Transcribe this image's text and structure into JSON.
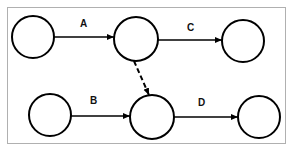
{
  "diagram": {
    "type": "activity-network",
    "nodes": [
      {
        "id": "n1",
        "label": ""
      },
      {
        "id": "n2",
        "label": ""
      },
      {
        "id": "n3",
        "label": ""
      },
      {
        "id": "n4",
        "label": ""
      },
      {
        "id": "n5",
        "label": ""
      },
      {
        "id": "n6",
        "label": ""
      }
    ],
    "edges": [
      {
        "from": "n1",
        "to": "n2",
        "label": "A",
        "style": "solid"
      },
      {
        "from": "n2",
        "to": "n3",
        "label": "C",
        "style": "solid"
      },
      {
        "from": "n4",
        "to": "n5",
        "label": "B",
        "style": "solid"
      },
      {
        "from": "n5",
        "to": "n6",
        "label": "D",
        "style": "solid"
      },
      {
        "from": "n2",
        "to": "n5",
        "label": "",
        "style": "dashed"
      }
    ],
    "colors": {
      "stroke": "#000000",
      "border": "#b0b0b0",
      "background": "#ffffff"
    }
  }
}
